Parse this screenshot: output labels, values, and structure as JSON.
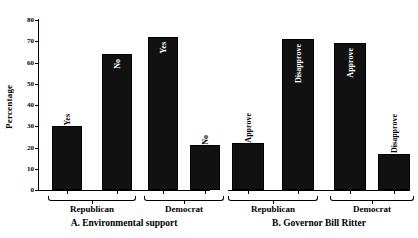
{
  "chart_data": {
    "type": "bar",
    "title": "",
    "ylabel": "Percentage",
    "xlabel": "",
    "ylim": [
      0,
      80
    ],
    "yticks": [
      0,
      10,
      20,
      30,
      40,
      50,
      60,
      70,
      80
    ],
    "grid": false,
    "legend": "none",
    "orientation": "vertical",
    "bar_color": "#111111",
    "panels": [
      {
        "id": "A",
        "caption": "A. Environmental support",
        "groups": [
          {
            "label": "Republican",
            "bars": [
              {
                "label": "Yes",
                "value": 30
              },
              {
                "label": "No",
                "value": 64
              }
            ]
          },
          {
            "label": "Democrat",
            "bars": [
              {
                "label": "Yes",
                "value": 72
              },
              {
                "label": "No",
                "value": 21
              }
            ]
          }
        ]
      },
      {
        "id": "B",
        "caption": "B. Governor Bill Ritter",
        "groups": [
          {
            "label": "Republican",
            "bars": [
              {
                "label": "Approve",
                "value": 22
              },
              {
                "label": "Disapprove",
                "value": 71
              }
            ]
          },
          {
            "label": "Democrat",
            "bars": [
              {
                "label": "Approve",
                "value": 69
              },
              {
                "label": "Disapprove",
                "value": 17
              }
            ]
          }
        ]
      }
    ],
    "categories": [
      "Republican",
      "Democrat"
    ],
    "series": [
      {
        "name": "A. Environmental support - Yes/Approve",
        "values": [
          30,
          72
        ]
      },
      {
        "name": "A. Environmental support - No/Disapprove",
        "values": [
          64,
          21
        ]
      },
      {
        "name": "B. Governor Bill Ritter - Approve",
        "values": [
          22,
          69
        ]
      },
      {
        "name": "B. Governor Bill Ritter - Disapprove",
        "values": [
          71,
          17
        ]
      }
    ]
  }
}
